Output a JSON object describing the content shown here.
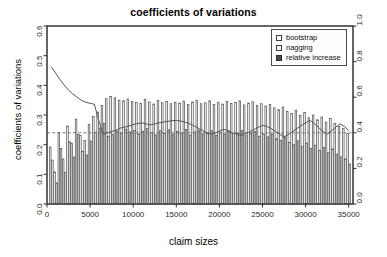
{
  "chart_data": {
    "type": "bar",
    "title": "coefficients of variations",
    "xlabel": "claim sizes",
    "ylabel": "coefficients of variations",
    "grid": false,
    "legend_position": "top-right",
    "xlim": [
      0,
      35500
    ],
    "ylim": [
      0.0,
      0.6
    ],
    "y2lim": [
      0.0,
      1.0
    ],
    "xticks": [
      0,
      5000,
      10000,
      15000,
      20000,
      25000,
      30000,
      35000
    ],
    "xticklabels": [
      "0",
      "5000",
      "10000",
      "15000",
      "20000",
      "25000",
      "30000",
      "35000"
    ],
    "yticks": [
      0.0,
      0.1,
      0.2,
      0.3,
      0.4,
      0.5,
      0.6
    ],
    "yticklabels": [
      "0.0",
      "0.1",
      "0.2",
      "0.3",
      "0.4",
      "0.5",
      "0.6"
    ],
    "y2ticks": [
      0.0,
      0.2,
      0.4,
      0.6,
      0.8,
      1.0
    ],
    "y2ticklabels": [
      "0.0",
      "0.2",
      "0.4",
      "0.6",
      "0.8",
      "1.0"
    ],
    "reference_line": {
      "axis": "right",
      "value": 0.4,
      "style": "dashed"
    },
    "x": [
      500,
      1000,
      1500,
      2000,
      2500,
      3000,
      3500,
      4000,
      4500,
      5000,
      5500,
      6000,
      6500,
      7000,
      7500,
      8000,
      8500,
      9000,
      9500,
      10000,
      10500,
      11000,
      11500,
      12000,
      12500,
      13000,
      13500,
      14000,
      14500,
      15000,
      15500,
      16000,
      16500,
      17000,
      17500,
      18000,
      18500,
      19000,
      19500,
      20000,
      20500,
      21000,
      21500,
      22000,
      22500,
      23000,
      23500,
      24000,
      24500,
      25000,
      25500,
      26000,
      26500,
      27000,
      27500,
      28000,
      28500,
      29000,
      29500,
      30000,
      30500,
      31000,
      31500,
      32000,
      32500,
      33000,
      33500,
      34000,
      34500,
      35000
    ],
    "series": [
      {
        "name": "bootstrap",
        "axis": "left",
        "values": [
          0.192,
          0.108,
          0.241,
          0.152,
          0.263,
          0.205,
          0.286,
          0.231,
          0.214,
          0.268,
          0.295,
          0.31,
          0.332,
          0.355,
          0.362,
          0.358,
          0.35,
          0.348,
          0.354,
          0.346,
          0.342,
          0.339,
          0.352,
          0.344,
          0.337,
          0.349,
          0.341,
          0.346,
          0.338,
          0.343,
          0.34,
          0.347,
          0.336,
          0.344,
          0.35,
          0.338,
          0.341,
          0.348,
          0.335,
          0.343,
          0.337,
          0.346,
          0.339,
          0.342,
          0.348,
          0.334,
          0.34,
          0.345,
          0.332,
          0.338,
          0.33,
          0.336,
          0.324,
          0.318,
          0.327,
          0.312,
          0.305,
          0.316,
          0.298,
          0.308,
          0.291,
          0.3,
          0.284,
          0.293,
          0.276,
          0.288,
          0.271,
          0.262,
          0.255,
          0.238
        ]
      },
      {
        "name": "nagging",
        "axis": "left",
        "values": [
          0.148,
          0.071,
          0.187,
          0.106,
          0.21,
          0.158,
          0.235,
          0.178,
          0.165,
          0.212,
          0.242,
          0.256,
          0.271,
          0.228,
          0.234,
          0.246,
          0.239,
          0.252,
          0.243,
          0.248,
          0.236,
          0.245,
          0.254,
          0.241,
          0.233,
          0.247,
          0.238,
          0.25,
          0.235,
          0.244,
          0.239,
          0.251,
          0.232,
          0.243,
          0.249,
          0.236,
          0.24,
          0.247,
          0.231,
          0.242,
          0.234,
          0.246,
          0.237,
          0.24,
          0.248,
          0.23,
          0.238,
          0.244,
          0.228,
          0.236,
          0.226,
          0.234,
          0.22,
          0.214,
          0.225,
          0.208,
          0.2,
          0.213,
          0.194,
          0.205,
          0.188,
          0.198,
          0.181,
          0.191,
          0.173,
          0.186,
          0.168,
          0.159,
          0.152,
          0.135
        ]
      },
      {
        "name": "relative increase",
        "axis": "right",
        "values": [
          0.77,
          0.735,
          0.7,
          0.668,
          0.64,
          0.618,
          0.6,
          0.582,
          0.572,
          0.566,
          0.56,
          0.47,
          0.392,
          0.4,
          0.408,
          0.414,
          0.426,
          0.432,
          0.438,
          0.446,
          0.452,
          0.456,
          0.45,
          0.444,
          0.45,
          0.456,
          0.46,
          0.464,
          0.468,
          0.47,
          0.466,
          0.46,
          0.452,
          0.44,
          0.428,
          0.414,
          0.4,
          0.392,
          0.398,
          0.41,
          0.42,
          0.412,
          0.4,
          0.392,
          0.386,
          0.394,
          0.406,
          0.418,
          0.43,
          0.442,
          0.436,
          0.424,
          0.408,
          0.392,
          0.378,
          0.39,
          0.406,
          0.424,
          0.44,
          0.456,
          0.47,
          0.452,
          0.43,
          0.408,
          0.392,
          0.41,
          0.432,
          0.45,
          0.436,
          0.412
        ]
      }
    ]
  },
  "legend": {
    "items": [
      {
        "label": "bootstrap",
        "swatch": "square-open"
      },
      {
        "label": "nagging",
        "swatch": "square-light"
      },
      {
        "label": "relative increase",
        "swatch": "square-filled"
      }
    ]
  },
  "colors": {
    "bar_bootstrap_fill": "#ffffff",
    "bar_nagging_fill": "#f2f2f2",
    "bar_stroke": "#4d4d4d",
    "line": "#555555",
    "reference_line": "#777777",
    "axis": "#333333",
    "background": "#ffffff"
  }
}
